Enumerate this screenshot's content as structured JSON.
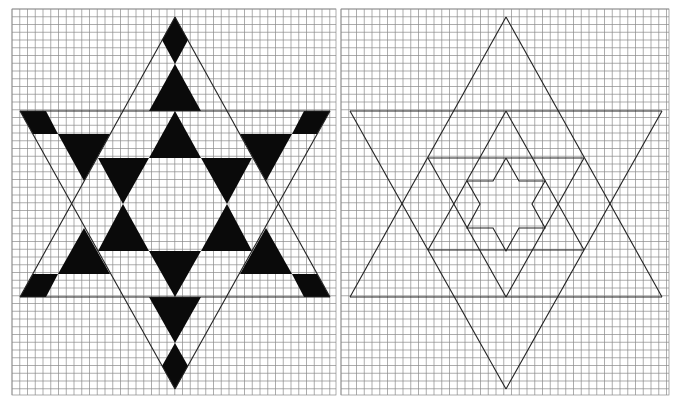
{
  "figure": {
    "panels": [
      {
        "id": "left",
        "description": "Hexagram on graph paper with alternating black triangles",
        "grid": {
          "x0": 12,
          "y0": 9,
          "x1": 336,
          "y1": 395,
          "cell": 7.75
        },
        "outline_lines": [
          [
            175,
            17,
            20,
            297
          ],
          [
            175,
            17,
            330,
            297
          ],
          [
            20,
            111,
            330,
            111
          ],
          [
            20,
            297,
            330,
            297
          ],
          [
            20,
            111,
            175,
            389
          ],
          [
            330,
            111,
            175,
            389
          ]
        ],
        "filled_polygons": [
          [
            [
              175,
              17
            ],
            [
              188,
              40
            ],
            [
              175,
              64
            ],
            [
              162,
              40
            ]
          ],
          [
            [
              175,
              64
            ],
            [
              201,
              111
            ],
            [
              149,
              111
            ]
          ],
          [
            [
              175,
              111
            ],
            [
              201,
              158
            ],
            [
              149,
              158
            ]
          ],
          [
            [
              20,
              111
            ],
            [
              46,
              111
            ],
            [
              58,
              134
            ],
            [
              33,
              134
            ]
          ],
          [
            [
              58,
              134
            ],
            [
              110,
              134
            ],
            [
              84,
              181
            ]
          ],
          [
            [
              98,
              158
            ],
            [
              149,
              158
            ],
            [
              123,
              204
            ]
          ],
          [
            [
              330,
              111
            ],
            [
              304,
              111
            ],
            [
              292,
              134
            ],
            [
              317,
              134
            ]
          ],
          [
            [
              292,
              134
            ],
            [
              240,
              134
            ],
            [
              266,
              181
            ]
          ],
          [
            [
              252,
              158
            ],
            [
              201,
              158
            ],
            [
              227,
              204
            ]
          ],
          [
            [
              123,
              204
            ],
            [
              149,
              251
            ],
            [
              98,
              251
            ]
          ],
          [
            [
              227,
              204
            ],
            [
              252,
              251
            ],
            [
              201,
              251
            ]
          ],
          [
            [
              84,
              228
            ],
            [
              110,
              274
            ],
            [
              58,
              274
            ]
          ],
          [
            [
              266,
              228
            ],
            [
              292,
              274
            ],
            [
              240,
              274
            ]
          ],
          [
            [
              33,
              274
            ],
            [
              58,
              274
            ],
            [
              46,
              297
            ],
            [
              20,
              297
            ]
          ],
          [
            [
              317,
              274
            ],
            [
              292,
              274
            ],
            [
              304,
              297
            ],
            [
              330,
              297
            ]
          ],
          [
            [
              149,
              251
            ],
            [
              201,
              251
            ],
            [
              175,
              297
            ]
          ],
          [
            [
              149,
              297
            ],
            [
              201,
              297
            ],
            [
              175,
              343
            ]
          ],
          [
            [
              175,
              343
            ],
            [
              188,
              366
            ],
            [
              175,
              389
            ],
            [
              162,
              366
            ]
          ]
        ]
      },
      {
        "id": "right",
        "description": "Nested hexagram outlines on graph paper",
        "grid": {
          "x0": 341,
          "y0": 9,
          "x1": 669,
          "y1": 395,
          "cell": 7.75
        },
        "outline_lines": [
          [
            506,
            17,
            350,
            297
          ],
          [
            506,
            17,
            662,
            297
          ],
          [
            350,
            111,
            662,
            111
          ],
          [
            350,
            297,
            662,
            297
          ],
          [
            350,
            111,
            506,
            389
          ],
          [
            662,
            111,
            506,
            389
          ],
          [
            506,
            111,
            428,
            250
          ],
          [
            506,
            111,
            584,
            250
          ],
          [
            428,
            158,
            584,
            158
          ],
          [
            428,
            250,
            584,
            250
          ],
          [
            428,
            158,
            506,
            297
          ],
          [
            584,
            158,
            506,
            297
          ]
        ],
        "polylines": [
          [
            [
              506,
              158
            ],
            [
              519,
              181
            ],
            [
              545,
              181
            ],
            [
              532,
              204
            ],
            [
              545,
              228
            ],
            [
              519,
              228
            ],
            [
              506,
              251
            ],
            [
              493,
              228
            ],
            [
              467,
              228
            ],
            [
              480,
              204
            ],
            [
              467,
              181
            ],
            [
              493,
              181
            ],
            [
              506,
              158
            ]
          ]
        ]
      }
    ],
    "colors": {
      "grid": "#8a8a8a",
      "line": "#222222",
      "fill": "#0a0a0a",
      "background": "#ffffff"
    }
  }
}
